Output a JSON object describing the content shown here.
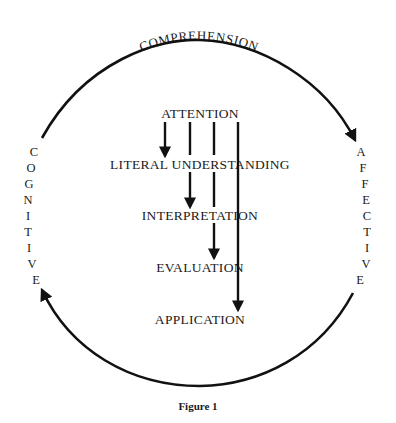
{
  "diagram": {
    "top_label": "COMPREHENSION",
    "left_label": "COGNITIVE",
    "right_label": "AFFECTIVE",
    "left_letters": [
      "C",
      "O",
      "G",
      "N",
      "I",
      "T",
      "I",
      "V",
      "E"
    ],
    "right_letters": [
      "A",
      "F",
      "F",
      "E",
      "C",
      "T",
      "I",
      "V",
      "E"
    ],
    "stages": [
      {
        "label": "ATTENTION"
      },
      {
        "label": "LITERAL UNDERSTANDING"
      },
      {
        "label": "INTERPRETATION"
      },
      {
        "label": "EVALUATION"
      },
      {
        "label": "APPLICATION"
      }
    ],
    "arrows": [
      {
        "from": "ATTENTION",
        "to": "LITERAL UNDERSTANDING"
      },
      {
        "from": "ATTENTION",
        "to": "INTERPRETATION"
      },
      {
        "from": "ATTENTION",
        "to": "EVALUATION"
      },
      {
        "from": "ATTENTION",
        "to": "APPLICATION"
      }
    ],
    "cycle": [
      {
        "from": "COGNITIVE",
        "to": "AFFECTIVE",
        "via": "top arc"
      },
      {
        "from": "AFFECTIVE",
        "to": "COGNITIVE",
        "via": "bottom arc"
      }
    ],
    "caption": "Figure 1"
  }
}
